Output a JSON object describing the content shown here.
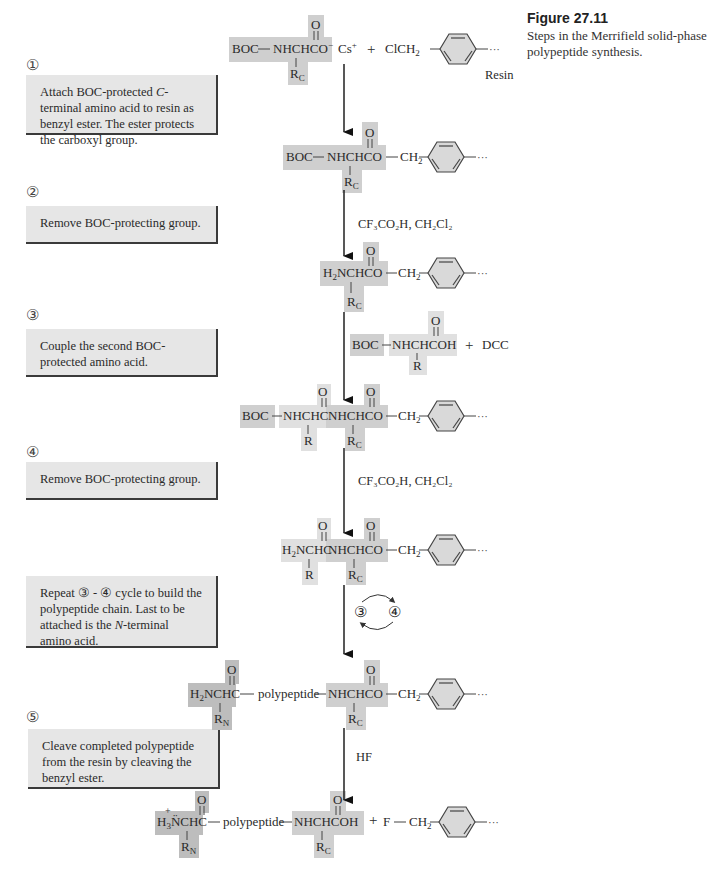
{
  "figure": {
    "title": "Figure 27.11",
    "caption": "Steps in the Merrifield solid-phase polypeptide synthesis."
  },
  "steps": [
    {
      "number": "①",
      "text_before": "Attach BOC-protected ",
      "italic": "C",
      "text_after": "-terminal amino acid to resin as benzyl ester. The ester protects the carboxyl group."
    },
    {
      "number": "②",
      "text": "Remove BOC-protecting group."
    },
    {
      "number": "③",
      "text": "Couple the second BOC-protected amino acid."
    },
    {
      "number": "④",
      "text": "Remove BOC-protecting group."
    },
    {
      "number": "",
      "text_before": "Repeat ③ - ④ cycle to build the polypeptide chain. Last to be attached is the ",
      "italic": "N",
      "text_after": "-terminal amino acid."
    },
    {
      "number": "⑤",
      "text": "Cleave completed polypeptide from the resin by cleaving the benzyl ester."
    }
  ],
  "labels": {
    "boc": "BOC",
    "resin": "Resin",
    "plus": "+",
    "oxygen": "O",
    "polypeptide": "polypeptide",
    "dcc": "DCC",
    "r": "R",
    "dots": "···",
    "fluorine": "F",
    "hf": "HF",
    "cycle_a": "③",
    "cycle_b": "④"
  },
  "reagents": {
    "deprotect": "CF₃CO₂H, CH₂Cl₂",
    "cleave": "HF"
  },
  "colors": {
    "box_fill": "#e6e6e6",
    "c_terminal_shade": "#cfcfcf",
    "second_aa_shade": "#e0e0e0",
    "n_terminal_shade": "#bdbdbd",
    "ring_fill": "#d9d9d9"
  }
}
